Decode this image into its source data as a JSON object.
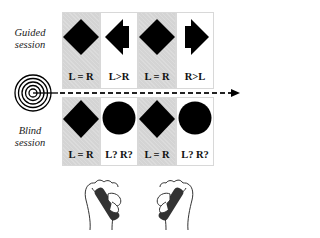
{
  "sessions": {
    "guided": {
      "label_line1": "Guided",
      "label_line2": "session",
      "cells": [
        {
          "shape": "diamond",
          "label": "L = R",
          "background": "gray"
        },
        {
          "shape": "left-arrow",
          "label": "L>R",
          "background": "white"
        },
        {
          "shape": "diamond",
          "label": "L = R",
          "background": "gray"
        },
        {
          "shape": "right-arrow",
          "label": "R>L",
          "background": "white"
        }
      ]
    },
    "blind": {
      "label_line1": "Blind",
      "label_line2": "session",
      "cells": [
        {
          "shape": "diamond",
          "label": "L = R",
          "background": "gray"
        },
        {
          "shape": "circle",
          "label": "L? R?",
          "background": "white"
        },
        {
          "shape": "diamond",
          "label": "L = R",
          "background": "gray"
        },
        {
          "shape": "circle",
          "label": "L? R?",
          "background": "white"
        }
      ]
    }
  },
  "timeline": {
    "start_icon": "concentric-target-icon",
    "line_style": "dashed",
    "end_icon": "arrowhead-icon"
  },
  "hands": [
    {
      "icon": "hand-gripping-handle-icon",
      "orientation": "right-tilt",
      "under_column": 2
    },
    {
      "icon": "hand-gripping-handle-icon",
      "orientation": "left-tilt",
      "under_column": 4
    }
  ],
  "colors": {
    "gray_cell": "#d4d4d4",
    "white_cell": "#ffffff",
    "shape_fill": "#000000",
    "text": "#111111",
    "handle_dark": "#333333"
  }
}
